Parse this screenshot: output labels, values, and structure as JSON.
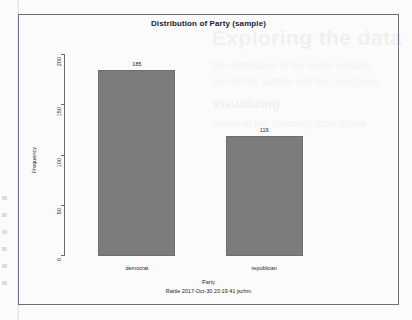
{
  "chart_data": {
    "type": "bar",
    "title": "Distribution of Party (sample)",
    "xlabel": "Party",
    "ylabel": "Frequency",
    "categories": [
      "democrat",
      "republican"
    ],
    "values": [
      185,
      119
    ],
    "value_labels": [
      "185",
      "119"
    ],
    "ylim": [
      0,
      200
    ],
    "yticks": [
      0,
      50,
      100,
      150,
      200
    ],
    "ytick_labels": [
      "0",
      "50",
      "100",
      "150",
      "200"
    ],
    "grid": false,
    "legend": "none",
    "bar_color": "#7c7c7c",
    "frame_color": "#6d6d84",
    "footer": "Rattle 2017-Oct-30 20:19:41 jschm"
  },
  "bleed": {
    "heading": "Exploring the data",
    "sub": "Visualizing",
    "lines": [
      "the distribution of the target variable",
      "across the sample and the categories",
      "shown in the summary table above"
    ]
  }
}
